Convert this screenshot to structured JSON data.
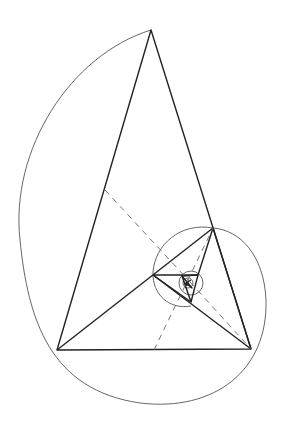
{
  "diagram": {
    "type": "golden-triangle-spiral",
    "colors": {
      "background": "#ffffff",
      "triangle_stroke": "#222222",
      "arc_stroke": "#555555",
      "dashed_stroke": "#666666"
    },
    "points": {
      "apex": [
        151,
        30
      ],
      "bottom_left": [
        57,
        350
      ],
      "bottom_right": [
        251,
        349
      ],
      "right": [
        213,
        228
      ],
      "mid_left": [
        153,
        275
      ],
      "inner_bottom": [
        191,
        302
      ],
      "inner_right": [
        198,
        275
      ],
      "inner_left": [
        182,
        275
      ],
      "center": [
        187,
        283
      ]
    }
  }
}
